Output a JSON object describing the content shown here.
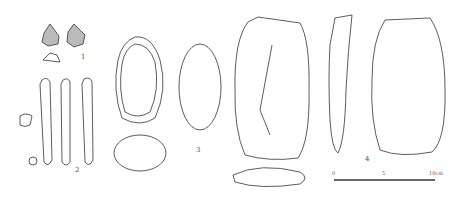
{
  "figure": {
    "type": "archaeological lithic illustration",
    "items": [
      {
        "number": "1",
        "description": "small triangular flaked points, two faces plus cross-section"
      },
      {
        "number": "2",
        "description": "elongated blade/rod tool, three views plus two cross-sections"
      },
      {
        "number": "3",
        "description": "ovoid pebble tool, face, profile and cross-section"
      },
      {
        "number": "4",
        "description": "large biface / handaxe, two faces, profile and cross-section"
      }
    ],
    "scale_bar": {
      "start": "0",
      "mid": "5",
      "end": "10cm"
    }
  }
}
